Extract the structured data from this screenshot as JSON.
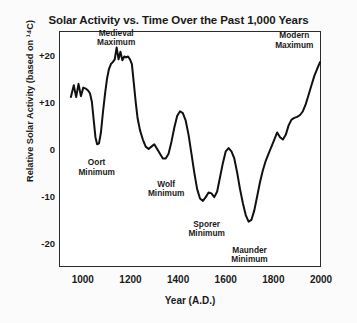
{
  "chart_data": {
    "type": "line",
    "title": "Solar Activity vs. Time Over the Past 1,000 Years",
    "xlabel": "Year (A.D.)",
    "ylabel": "Relative Solar Activity (based on ¹⁴C)",
    "xlim": [
      900,
      2000
    ],
    "ylim": [
      -25,
      25
    ],
    "xticks": [
      1000,
      1200,
      1400,
      1600,
      1800,
      2000
    ],
    "xtick_labels": [
      "1000",
      "1200",
      "1400",
      "1600",
      "1800",
      "2000"
    ],
    "yticks": [
      20,
      10,
      0,
      -10,
      -20
    ],
    "ytick_labels": [
      "+20",
      "+10",
      "0",
      "-10",
      "-20"
    ],
    "grid": false,
    "legend": false,
    "line_color": "#111111",
    "line_width": 2.0,
    "series": [
      {
        "name": "Relative Solar Activity",
        "x": [
          950,
          962,
          972,
          982,
          992,
          1002,
          1012,
          1022,
          1030,
          1038,
          1046,
          1053,
          1060,
          1068,
          1076,
          1085,
          1094,
          1102,
          1110,
          1118,
          1126,
          1134,
          1142,
          1150,
          1158,
          1166,
          1174,
          1182,
          1190,
          1198,
          1206,
          1214,
          1222,
          1230,
          1240,
          1252,
          1264,
          1276,
          1288,
          1300,
          1312,
          1324,
          1336,
          1348,
          1360,
          1372,
          1384,
          1396,
          1408,
          1420,
          1432,
          1444,
          1456,
          1468,
          1480,
          1492,
          1504,
          1516,
          1528,
          1540,
          1552,
          1564,
          1576,
          1588,
          1600,
          1612,
          1624,
          1636,
          1648,
          1660,
          1672,
          1684,
          1696,
          1708,
          1720,
          1732,
          1744,
          1756,
          1768,
          1780,
          1792,
          1804,
          1816,
          1828,
          1840,
          1852,
          1864,
          1876,
          1888,
          1900,
          1912,
          1924,
          1936,
          1948,
          1960,
          1972,
          1984,
          1996
        ],
        "y": [
          11.0,
          13.5,
          11.0,
          13.8,
          11.2,
          13.0,
          12.8,
          12.4,
          11.8,
          10.0,
          6.0,
          2.5,
          1.0,
          1.2,
          3.5,
          8.0,
          12.0,
          15.0,
          17.0,
          18.0,
          18.4,
          19.0,
          21.5,
          19.0,
          20.6,
          18.8,
          19.6,
          19.4,
          19.6,
          19.0,
          18.0,
          14.0,
          10.0,
          6.5,
          4.0,
          2.0,
          0.5,
          0.0,
          0.5,
          1.0,
          0.0,
          -1.0,
          -2.0,
          -2.0,
          -1.0,
          1.5,
          4.5,
          7.0,
          8.0,
          7.6,
          6.0,
          3.0,
          -1.0,
          -5.0,
          -8.5,
          -10.5,
          -11.0,
          -10.2,
          -9.2,
          -9.4,
          -10.2,
          -9.0,
          -6.0,
          -3.0,
          -0.5,
          0.2,
          -0.5,
          -2.0,
          -5.0,
          -8.5,
          -11.5,
          -14.0,
          -15.4,
          -15.0,
          -13.0,
          -10.0,
          -7.0,
          -4.5,
          -2.5,
          -1.0,
          0.5,
          2.0,
          3.5,
          2.5,
          2.0,
          3.0,
          5.0,
          6.2,
          6.6,
          6.8,
          7.2,
          8.0,
          9.5,
          11.5,
          13.5,
          15.5,
          17.0,
          18.4
        ]
      }
    ],
    "annotations": [
      {
        "label": "Medieval\nMaximum",
        "x": 1140,
        "y": 25.5,
        "name": "medieval-maximum"
      },
      {
        "label": "Oort\nMinimum",
        "x": 1058,
        "y": -2.0,
        "name": "oort-minimum"
      },
      {
        "label": "Wolf\nMinimum",
        "x": 1350,
        "y": -6.5,
        "name": "wolf-minimum"
      },
      {
        "label": "Sporer\nMinimum",
        "x": 1520,
        "y": -15.0,
        "name": "sporer-minimum"
      },
      {
        "label": "Maunder\nMinimum",
        "x": 1700,
        "y": -20.5,
        "name": "maunder-minimum"
      },
      {
        "label": "Modern\nMaximum",
        "x": 1888,
        "y": 25.0,
        "name": "modern-maximum"
      }
    ]
  }
}
